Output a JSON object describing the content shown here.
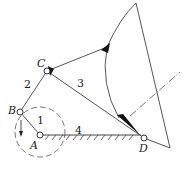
{
  "diagram": {
    "type": "four-bar linkage mechanism",
    "joints": {
      "A": {
        "label": "A",
        "x": 40,
        "y": 135
      },
      "B": {
        "label": "B",
        "x": 20,
        "y": 112
      },
      "C": {
        "label": "C",
        "x": 47,
        "y": 71
      },
      "D": {
        "label": "D",
        "x": 144,
        "y": 138
      }
    },
    "links": [
      {
        "id": "1",
        "label": "1",
        "from": "A",
        "to": "B"
      },
      {
        "id": "2",
        "label": "2",
        "from": "B",
        "to": "C"
      },
      {
        "id": "3",
        "label": "3",
        "from": "C",
        "to": "D"
      },
      {
        "id": "4",
        "label": "4",
        "from": "A",
        "to": "D",
        "fixed": true
      }
    ],
    "colors": {
      "line": "#555555",
      "fill": "#111111",
      "background": "#ffffff"
    }
  }
}
